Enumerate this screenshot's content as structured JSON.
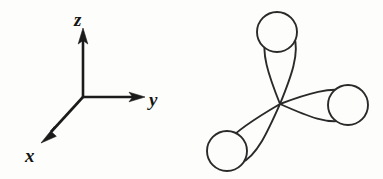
{
  "figure": {
    "background_color": "#fdfdfb",
    "ink_color": "#1b1b1b",
    "panels": [
      {
        "id": "axes",
        "name": "coordinate-axes"
      },
      {
        "id": "orbitals",
        "name": "orbital-lobes"
      }
    ]
  },
  "axes": {
    "origin": {
      "x": 83,
      "y": 97
    },
    "stroke_color": "#1b1b1b",
    "items": [
      {
        "key": "z",
        "label": "z",
        "direction": "up",
        "line": {
          "x1": 83,
          "y1": 97,
          "x2": 83,
          "y2": 38
        },
        "tip": {
          "x": 83,
          "y": 29
        },
        "label_pos": {
          "x": 74,
          "y": 26
        }
      },
      {
        "key": "y",
        "label": "y",
        "direction": "right",
        "line": {
          "x1": 83,
          "y1": 97,
          "x2": 133,
          "y2": 97
        },
        "tip": {
          "x": 144,
          "y": 97
        },
        "label_pos": {
          "x": 148,
          "y": 105
        }
      },
      {
        "key": "x",
        "direction": "down-left",
        "label": "x",
        "line": {
          "x1": 83,
          "y1": 97,
          "x2": 50,
          "y2": 133
        },
        "tip": {
          "x": 42,
          "y": 142
        },
        "label_pos": {
          "x": 25,
          "y": 162
        }
      }
    ]
  },
  "orbitals": {
    "center": {
      "x": 280,
      "y": 103
    },
    "stroke_color": "#2a2a2a",
    "cap_fill": "#fdfdfb",
    "lobe_count": 3,
    "lobes": [
      {
        "key": "lobe-up",
        "name": "orbital-lobe-up",
        "angle_deg": -90,
        "tip_length": 78,
        "half_width": 22,
        "cap": {
          "cx": 277,
          "cy": 32,
          "r": 20
        }
      },
      {
        "key": "lobe-right",
        "name": "orbital-lobe-right",
        "angle_deg": 8,
        "tip_length": 72,
        "half_width": 21,
        "cap": {
          "cx": 348,
          "cy": 105,
          "r": 20
        }
      },
      {
        "key": "lobe-lower-left",
        "name": "orbital-lobe-lower-left",
        "angle_deg": 143,
        "tip_length": 70,
        "half_width": 21,
        "cap": {
          "cx": 227,
          "cy": 151,
          "r": 20
        }
      }
    ]
  }
}
